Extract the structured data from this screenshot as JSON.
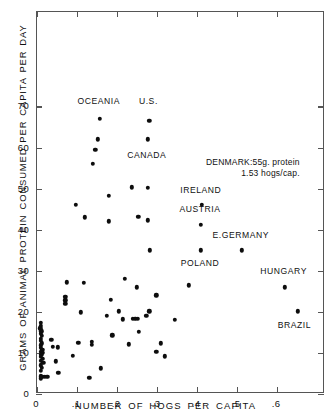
{
  "chart": {
    "type": "scatter",
    "title": "",
    "xlabel": "NUMBER  OF  HOGS  PER  CAPITA",
    "ylabel": "GRAMS  OF  ANIMAL  PROTEIN  CONSUMED  PER  CAPITA  PER  DAY",
    "xlim": [
      0,
      0.72
    ],
    "ylim": [
      0,
      93
    ],
    "xticks": [
      0,
      0.1,
      0.2,
      0.3,
      0.4,
      0.5,
      0.6
    ],
    "xticklabels": [
      "0",
      ".1",
      ".2",
      ".3",
      ".4",
      ".5",
      ".6"
    ],
    "yticks": [
      0,
      10,
      20,
      30,
      40,
      50,
      60,
      70
    ],
    "yticklabels": [
      "0",
      "10",
      "20",
      "30",
      "40",
      "50",
      "60",
      "70"
    ],
    "grid": false,
    "legend": "none",
    "marker_color": "#0d0d0d",
    "frame_color": "#555555"
  },
  "chart_data": {
    "type": "scatter",
    "title": "",
    "xlabel": "NUMBER OF HOGS PER CAPITA",
    "ylabel": "GRAMS OF ANIMAL PROTEIN CONSUMED PER CAPITA PER DAY",
    "xlim": [
      0,
      0.72
    ],
    "ylim": [
      0,
      93
    ],
    "grid": false,
    "legend": "none",
    "points": [
      {
        "x": 0.157,
        "y": 67.0,
        "label": "OCEANIA"
      },
      {
        "x": 0.281,
        "y": 66.5,
        "label": "U.S."
      },
      {
        "x": 0.152,
        "y": 62.0
      },
      {
        "x": 0.277,
        "y": 62.0,
        "label": "CANADA"
      },
      {
        "x": 0.146,
        "y": 59.5
      },
      {
        "x": 0.139,
        "y": 56.0
      },
      {
        "x": 0.237,
        "y": 50.3
      },
      {
        "x": 0.277,
        "y": 50.2
      },
      {
        "x": 0.18,
        "y": 48.3
      },
      {
        "x": 0.097,
        "y": 46.0
      },
      {
        "x": 0.412,
        "y": 46.0,
        "label": "IRELAND"
      },
      {
        "x": 0.253,
        "y": 43.2
      },
      {
        "x": 0.119,
        "y": 43.0
      },
      {
        "x": 0.277,
        "y": 42.3
      },
      {
        "x": 0.18,
        "y": 42.0
      },
      {
        "x": 0.41,
        "y": 41.2,
        "label": "AUSTRIA"
      },
      {
        "x": 0.282,
        "y": 35.0
      },
      {
        "x": 0.41,
        "y": 35.0,
        "label": "POLAND"
      },
      {
        "x": 0.512,
        "y": 35.0,
        "label": "E.GERMANY"
      },
      {
        "x": 0.22,
        "y": 28.0
      },
      {
        "x": 0.074,
        "y": 27.2
      },
      {
        "x": 0.117,
        "y": 27.0
      },
      {
        "x": 0.38,
        "y": 26.5
      },
      {
        "x": 0.249,
        "y": 26.0
      },
      {
        "x": 0.619,
        "y": 26.0,
        "label": "HUNGARY"
      },
      {
        "x": 0.298,
        "y": 24.0
      },
      {
        "x": 0.184,
        "y": 23.0
      },
      {
        "x": 0.071,
        "y": 23.6
      },
      {
        "x": 0.071,
        "y": 22.8
      },
      {
        "x": 0.071,
        "y": 22.0
      },
      {
        "x": 0.652,
        "y": 20.1,
        "label": "BRAZIL"
      },
      {
        "x": 0.11,
        "y": 19.9
      },
      {
        "x": 0.205,
        "y": 20.1
      },
      {
        "x": 0.281,
        "y": 20.1
      },
      {
        "x": 0.175,
        "y": 19.1
      },
      {
        "x": 0.273,
        "y": 19.0
      },
      {
        "x": 0.345,
        "y": 18.0
      },
      {
        "x": 0.214,
        "y": 18.2
      },
      {
        "x": 0.239,
        "y": 18.3
      },
      {
        "x": 0.246,
        "y": 18.3
      },
      {
        "x": 0.252,
        "y": 18.3
      },
      {
        "x": 0.01,
        "y": 17.3
      },
      {
        "x": 0.01,
        "y": 16.6
      },
      {
        "x": 0.008,
        "y": 16.0
      },
      {
        "x": 0.011,
        "y": 15.3
      },
      {
        "x": 0.009,
        "y": 14.7
      },
      {
        "x": 0.255,
        "y": 15.2
      },
      {
        "x": 0.012,
        "y": 14.1
      },
      {
        "x": 0.188,
        "y": 14.3
      },
      {
        "x": 0.01,
        "y": 13.5
      },
      {
        "x": 0.036,
        "y": 13.2
      },
      {
        "x": 0.009,
        "y": 12.9
      },
      {
        "x": 0.012,
        "y": 12.3
      },
      {
        "x": 0.103,
        "y": 12.5
      },
      {
        "x": 0.229,
        "y": 12.1
      },
      {
        "x": 0.01,
        "y": 11.9
      },
      {
        "x": 0.04,
        "y": 11.5
      },
      {
        "x": 0.052,
        "y": 11.4
      },
      {
        "x": 0.137,
        "y": 12.7
      },
      {
        "x": 0.137,
        "y": 12.0
      },
      {
        "x": 0.31,
        "y": 12.3
      },
      {
        "x": 0.009,
        "y": 11.2
      },
      {
        "x": 0.013,
        "y": 10.7
      },
      {
        "x": 0.009,
        "y": 10.2
      },
      {
        "x": 0.015,
        "y": 10.0
      },
      {
        "x": 0.011,
        "y": 9.5
      },
      {
        "x": 0.09,
        "y": 9.3
      },
      {
        "x": 0.009,
        "y": 9.0
      },
      {
        "x": 0.014,
        "y": 8.6
      },
      {
        "x": 0.298,
        "y": 10.3
      },
      {
        "x": 0.32,
        "y": 9.2
      },
      {
        "x": 0.01,
        "y": 8.1
      },
      {
        "x": 0.047,
        "y": 8.0
      },
      {
        "x": 0.016,
        "y": 7.6
      },
      {
        "x": 0.009,
        "y": 7.0
      },
      {
        "x": 0.012,
        "y": 6.4
      },
      {
        "x": 0.159,
        "y": 6.3
      },
      {
        "x": 0.01,
        "y": 5.6
      },
      {
        "x": 0.053,
        "y": 5.1
      },
      {
        "x": 0.009,
        "y": 4.3
      },
      {
        "x": 0.013,
        "y": 4.2
      },
      {
        "x": 0.019,
        "y": 4.2
      },
      {
        "x": 0.026,
        "y": 4.2
      },
      {
        "x": 0.009,
        "y": 3.8
      },
      {
        "x": 0.131,
        "y": 3.9
      }
    ],
    "annotations": [
      {
        "text": "OCEANIA",
        "x": 0.157,
        "y": 71.0,
        "align": "center"
      },
      {
        "text": "U.S.",
        "x": 0.281,
        "y": 71.0,
        "align": "center"
      },
      {
        "text": "CANADA",
        "x": 0.277,
        "y": 58.0,
        "align": "center"
      },
      {
        "text": "IRELAND",
        "x": 0.412,
        "y": 49.5,
        "align": "center"
      },
      {
        "text": "AUSTRIA",
        "x": 0.41,
        "y": 44.8,
        "align": "center"
      },
      {
        "text": "E.GERMANY",
        "x": 0.512,
        "y": 38.5,
        "align": "center"
      },
      {
        "text": "POLAND",
        "x": 0.41,
        "y": 31.6,
        "align": "center"
      },
      {
        "text": "HUNGARY",
        "x": 0.619,
        "y": 29.6,
        "align": "center"
      },
      {
        "text": "BRAZIL",
        "x": 0.646,
        "y": 16.6,
        "align": "center"
      }
    ],
    "note": {
      "line1": "DENMARK:55g. protein",
      "line2": "1.53 hogs/cap.",
      "x": 0.425,
      "y": 56.0
    }
  }
}
